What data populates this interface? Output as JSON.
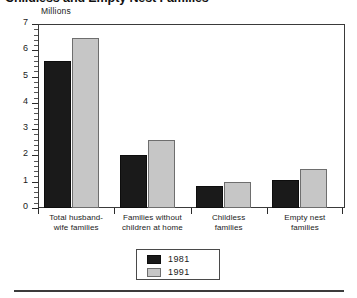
{
  "chart_data": {
    "type": "bar",
    "title": "Childless and Empty Nest Families",
    "xlabel": "",
    "ylabel": "Millions",
    "ylim": [
      0,
      7
    ],
    "ytick_labels": [
      "0",
      "1",
      "2",
      "3",
      "4",
      "5",
      "6",
      "7"
    ],
    "grid": false,
    "legend_position": "bottom-center",
    "categories": [
      "Total husband-\nwife families",
      "Families without\nchildren at home",
      "Childless\nfamilies",
      "Empty nest\nfamilies"
    ],
    "category_lines": [
      [
        "Total husband-",
        "wife families"
      ],
      [
        "Families without",
        "children at home"
      ],
      [
        "Childless",
        "families"
      ],
      [
        "Empty nest",
        "families"
      ]
    ],
    "series": [
      {
        "name": "1981",
        "color": "#1a1a1a",
        "values": [
          5.6,
          2.0,
          0.85,
          1.05
        ]
      },
      {
        "name": "1991",
        "color": "#c6c6c6",
        "values": [
          6.45,
          2.6,
          1.0,
          1.5
        ]
      }
    ]
  },
  "legend": {
    "entries": [
      {
        "label": "1981"
      },
      {
        "label": "1991"
      }
    ]
  },
  "axis": {
    "unit_caption": "Millions"
  }
}
